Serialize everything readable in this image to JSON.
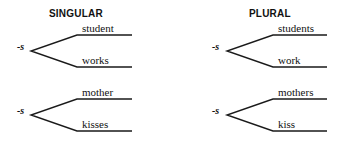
{
  "headings": {
    "singular": "SINGULAR",
    "plural": "PLURAL"
  },
  "diagrams": [
    {
      "column": "singular",
      "suffix": "-s",
      "upper": "student",
      "lower": "works"
    },
    {
      "column": "plural",
      "suffix": "-s",
      "upper": "students",
      "lower": "work"
    },
    {
      "column": "singular",
      "suffix": "-s",
      "upper": "mother",
      "lower": "kisses"
    },
    {
      "column": "plural",
      "suffix": "-s",
      "upper": "mothers",
      "lower": "kiss"
    }
  ],
  "colors": {
    "line": "#1a1a1a",
    "text": "#111111",
    "background": "#ffffff"
  }
}
